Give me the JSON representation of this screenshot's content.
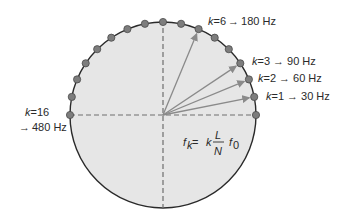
{
  "diagram": {
    "colors": {
      "circle_fill": "#e6e6e6",
      "circle_stroke": "#2a2a2a",
      "dot_fill": "#7d7d7d",
      "dot_stroke": "#4a4a4a",
      "arrow": "#8a8a8a",
      "dashed": "#6e6e6e",
      "text": "#2a2a2a"
    },
    "circle": {
      "cx": 163,
      "cy": 115,
      "r": 93
    },
    "dots_count": 17,
    "dot_angle_step_deg": 11.25,
    "arrows_to_k": [
      1,
      2,
      3,
      6
    ],
    "labels": [
      {
        "id": "k6",
        "k_text": "k",
        "eq": "=6",
        "arrow": "→",
        "freq": "180 Hz"
      },
      {
        "id": "k3",
        "k_text": "k",
        "eq": "=3",
        "arrow": "→",
        "freq": "90 Hz"
      },
      {
        "id": "k2",
        "k_text": "k",
        "eq": "=2",
        "arrow": "→",
        "freq": "60 Hz"
      },
      {
        "id": "k1",
        "k_text": "k",
        "eq": "=1",
        "arrow": "→",
        "freq": "30 Hz"
      },
      {
        "id": "k16",
        "k_text": "k",
        "eq": "=16",
        "arrow": "→",
        "freq": "480 Hz"
      }
    ],
    "formula": {
      "lhs": "f",
      "lhs_sub": "k",
      "equals": " = ",
      "k": "k",
      "numerator": "L",
      "denominator": "N",
      "f0": "f",
      "f0_sub": "0"
    }
  }
}
